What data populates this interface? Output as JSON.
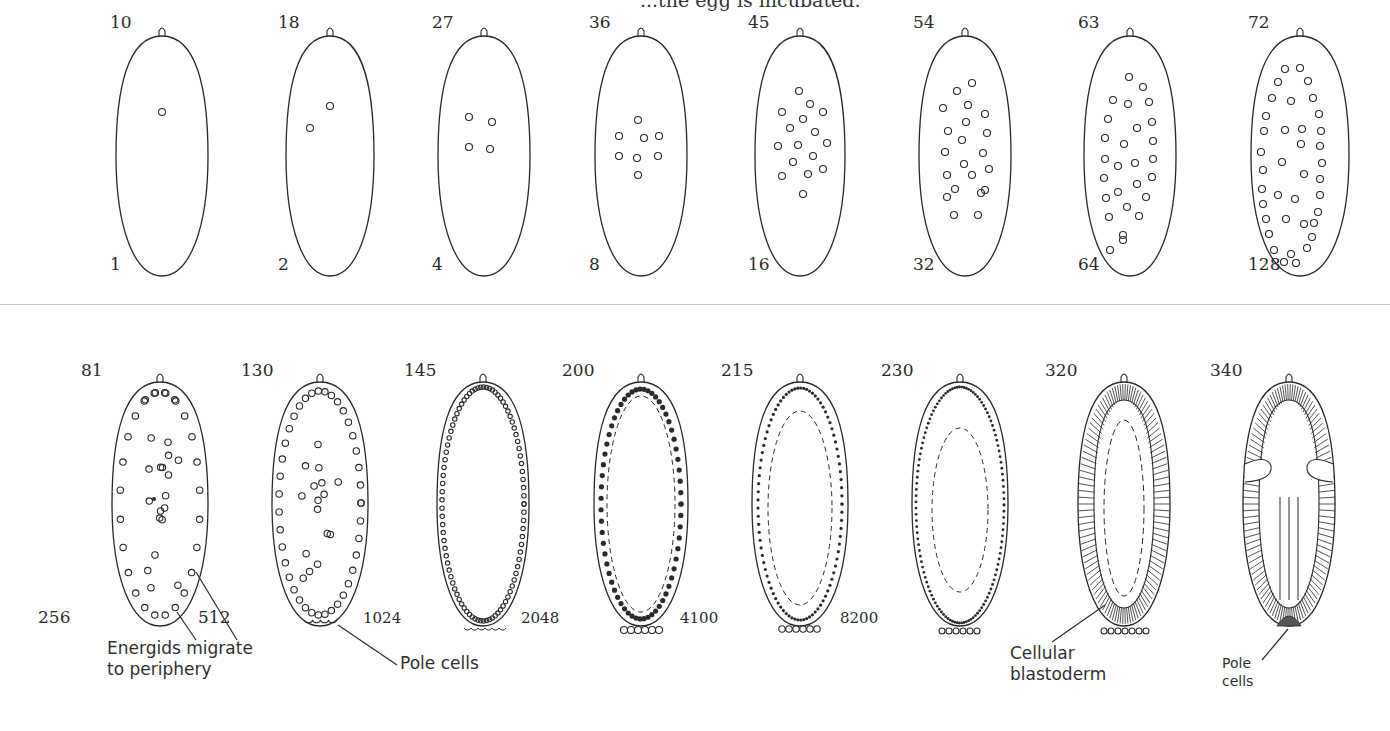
{
  "caption_top": "...the egg is incubated.",
  "rows": [
    {
      "name": "top-row",
      "stages": [
        {
          "minutes": "10",
          "nuclei": "1"
        },
        {
          "minutes": "18",
          "nuclei": "2"
        },
        {
          "minutes": "27",
          "nuclei": "4"
        },
        {
          "minutes": "36",
          "nuclei": "8"
        },
        {
          "minutes": "45",
          "nuclei": "16"
        },
        {
          "minutes": "54",
          "nuclei": "32"
        },
        {
          "minutes": "63",
          "nuclei": "64"
        },
        {
          "minutes": "72",
          "nuclei": "128"
        }
      ]
    },
    {
      "name": "bottom-row",
      "stages": [
        {
          "minutes": "81",
          "nuclei": "256"
        },
        {
          "minutes": "130",
          "nuclei": "512"
        },
        {
          "minutes": "145",
          "nuclei": "1024"
        },
        {
          "minutes": "200",
          "nuclei": "2048"
        },
        {
          "minutes": "215",
          "nuclei": "4100"
        },
        {
          "minutes": "230",
          "nuclei": "8200"
        },
        {
          "minutes": "320",
          "nuclei": ""
        },
        {
          "minutes": "340",
          "nuclei": ""
        }
      ]
    }
  ],
  "annotations": {
    "energids": "Energids migrate\nto periphery",
    "pole_cells_1": "Pole cells",
    "cellular_blastoderm": "Cellular\nblastoderm",
    "pole_cells_2": "Pole\ncells"
  },
  "colors": {
    "ink": "#2a2a2a",
    "background": "#ffffff",
    "divider": "#c9c9c9"
  }
}
